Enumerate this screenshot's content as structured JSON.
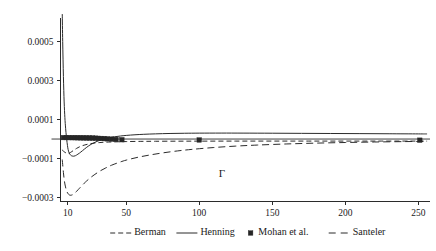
{
  "figure": {
    "background_color": "#ffffff",
    "ink_color": "#2b2b2b",
    "inner_annotation": "Γ"
  },
  "chart_data": {
    "type": "line",
    "title": "",
    "xlabel": "",
    "ylabel": "",
    "inner_label": "Γ",
    "grid": false,
    "legend_position": "bottom",
    "xlim": [
      5,
      258
    ],
    "ylim": [
      -0.00032,
      0.00062
    ],
    "xticks": [
      10,
      50,
      100,
      150,
      200,
      250
    ],
    "xtick_labels": [
      "10",
      "50",
      "100",
      "150",
      "200",
      "250"
    ],
    "yticks": [
      0.0005,
      0.0003,
      0.0001,
      -0.0001,
      -0.0003
    ],
    "ytick_labels": [
      "0.0005",
      "0.0003",
      "0.0001",
      "−0.0001",
      "−0.0003"
    ],
    "zero_line": 0.0,
    "series": [
      {
        "name": "Berman",
        "style": "dashed",
        "marker": "none",
        "color": "#2b2b2b",
        "x": [
          6,
          7,
          8,
          9,
          10,
          11,
          12,
          14,
          16,
          18,
          20,
          24,
          28,
          32,
          36,
          40,
          45,
          50,
          60,
          70,
          85,
          100,
          125,
          150,
          175,
          200,
          225,
          250,
          256
        ],
        "y": [
          -5.5e-05,
          -6.2e-05,
          -6.8e-05,
          -7.2e-05,
          -7.4e-05,
          -7.2e-05,
          -6.8e-05,
          -5.8e-05,
          -4.8e-05,
          -4e-05,
          -3.4e-05,
          -2.6e-05,
          -2.1e-05,
          -1.8e-05,
          -1.6e-05,
          -1.5e-05,
          -1.4e-05,
          -1.3e-05,
          -1.2e-05,
          -1.15e-05,
          -1.1e-05,
          -1.08e-05,
          -1.06e-05,
          -1.05e-05,
          -1.05e-05,
          -1.05e-05,
          -1.05e-05,
          -1.06e-05,
          -1.07e-05
        ]
      },
      {
        "name": "Henning",
        "style": "solid",
        "marker": "none",
        "color": "#2b2b2b",
        "x": [
          6.2,
          6.5,
          7,
          7.5,
          8,
          8.5,
          9,
          9.5,
          10,
          10.5,
          11,
          12,
          13,
          14,
          15,
          16,
          18,
          20,
          23,
          26,
          30,
          34,
          38,
          42,
          46,
          50,
          56,
          62,
          70,
          80,
          90,
          100,
          115,
          130,
          150,
          170,
          190,
          210,
          230,
          250,
          256
        ],
        "y": [
          0.00064,
          0.0005,
          0.00032,
          0.00019,
          0.00011,
          5.5e-05,
          1.5e-05,
          -1.8e-05,
          -4.5e-05,
          -6.2e-05,
          -7.2e-05,
          -8.3e-05,
          -8.7e-05,
          -8.8e-05,
          -8.6e-05,
          -8.2e-05,
          -7.2e-05,
          -6e-05,
          -4.2e-05,
          -2.7e-05,
          -1.2e-05,
          -1.5e-06,
          6e-06,
          1.15e-05,
          1.55e-05,
          1.85e-05,
          2.18e-05,
          2.42e-05,
          2.65e-05,
          2.85e-05,
          2.96e-05,
          3.02e-05,
          3.05e-05,
          3.03e-05,
          2.98e-05,
          2.91e-05,
          2.84e-05,
          2.77e-05,
          2.7e-05,
          2.63e-05,
          2.61e-05
        ]
      },
      {
        "name": "Mohan et al.",
        "style": "markers",
        "marker": "square",
        "color": "#262626",
        "x": [
          7,
          9,
          11,
          13,
          15,
          17,
          19,
          21,
          23,
          25,
          27,
          29,
          31,
          33,
          35,
          37,
          40,
          43,
          47,
          100,
          251
        ],
        "y": [
          7.5e-06,
          7.5e-06,
          7.2e-06,
          7e-06,
          6.8e-06,
          6.5e-06,
          6.2e-06,
          6e-06,
          5.6e-06,
          5.2e-06,
          4.8e-06,
          4.2e-06,
          3.6e-06,
          3e-06,
          2.2e-06,
          1.2e-06,
          -5e-07,
          -2e-06,
          -3.5e-06,
          -4.8e-06,
          -6e-06
        ]
      },
      {
        "name": "Santeler",
        "style": "long-dashed",
        "marker": "none",
        "color": "#2b2b2b",
        "x": [
          6.2,
          6.6,
          7,
          7.5,
          8,
          9,
          10,
          11,
          12,
          13,
          14,
          15,
          16,
          17,
          18,
          20,
          22,
          25,
          28,
          32,
          36,
          40,
          45,
          50,
          58,
          66,
          75,
          85,
          95,
          110,
          125,
          140,
          160,
          180,
          200,
          220,
          240,
          256
        ],
        "y": [
          -0.000105,
          -0.00014,
          -0.000172,
          -0.000205,
          -0.00023,
          -0.000262,
          -0.000278,
          -0.000286,
          -0.000288,
          -0.000286,
          -0.000282,
          -0.000276,
          -0.000268,
          -0.00026,
          -0.000252,
          -0.000236,
          -0.000221,
          -0.000201,
          -0.000184,
          -0.000164,
          -0.000148,
          -0.000134,
          -0.00012,
          -0.000108,
          -9.35e-05,
          -8.2e-05,
          -7.1e-05,
          -6.1e-05,
          -5.3e-05,
          -4.35e-05,
          -3.62e-05,
          -3.08e-05,
          -2.52e-05,
          -2.1e-05,
          -1.78e-05,
          -1.52e-05,
          -1.32e-05,
          -1.2e-05
        ]
      }
    ]
  },
  "legend": {
    "entries": [
      {
        "label": "Berman",
        "style": "dashed",
        "marker": "none"
      },
      {
        "label": "Henning",
        "style": "solid",
        "marker": "none"
      },
      {
        "label": "Mohan et al.",
        "style": "marker-only",
        "marker": "square"
      },
      {
        "label": "Santeler",
        "style": "long-dashed",
        "marker": "none"
      }
    ]
  }
}
